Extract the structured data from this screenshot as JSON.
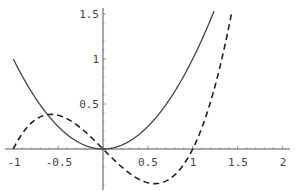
{
  "chart_data": {
    "type": "line",
    "title": "",
    "xlabel": "",
    "ylabel": "",
    "xlim": [
      -1,
      2
    ],
    "ylim": [
      -0.45,
      1.55
    ],
    "grid": false,
    "legend": null,
    "x_ticks": [
      "-1",
      "-0.5",
      "0.5",
      "1",
      "1.5",
      "2"
    ],
    "y_ticks": [
      "0.5",
      "1",
      "1.5"
    ],
    "series": [
      {
        "name": "solid",
        "style": "solid",
        "formula": "x^2",
        "x": [
          -1.0,
          -0.75,
          -0.5,
          -0.25,
          0.0,
          0.25,
          0.5,
          0.75,
          1.0,
          1.245
        ],
        "y": [
          1.0,
          0.5625,
          0.25,
          0.0625,
          0.0,
          0.0625,
          0.25,
          0.5625,
          1.0,
          1.55
        ]
      },
      {
        "name": "dashed",
        "style": "dashed",
        "formula": "x^3 - x",
        "x": [
          -1.0,
          -0.75,
          -0.577,
          -0.5,
          -0.25,
          0.0,
          0.25,
          0.5,
          0.577,
          0.75,
          1.0,
          1.25,
          1.5
        ],
        "y": [
          0.0,
          0.328,
          0.385,
          0.375,
          0.234,
          0.0,
          -0.234,
          -0.375,
          -0.385,
          -0.328,
          0.0,
          0.703,
          1.55
        ]
      }
    ]
  },
  "axes": {
    "x_tick_labels": [
      "-1",
      "-0.5",
      "0.5",
      "1",
      "1.5",
      "2"
    ],
    "y_tick_labels": [
      "0.5",
      "1",
      "1.5"
    ]
  }
}
